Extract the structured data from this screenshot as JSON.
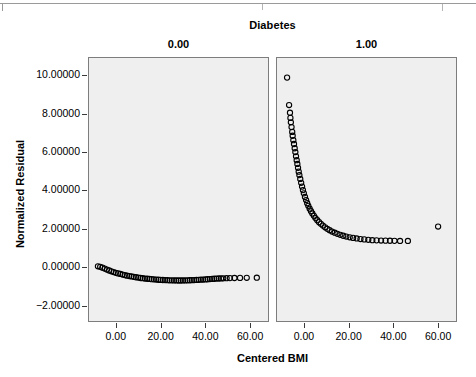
{
  "chart_data": {
    "type": "scatter",
    "title": "Diabetes",
    "xlabel": "Centered BMI",
    "ylabel": "Normalized Residual",
    "grid": false,
    "legend": "none",
    "facet_variable": "Diabetes",
    "panels": [
      {
        "label": "0.00",
        "xlim": [
          -12.0,
          68.0
        ],
        "ylim": [
          -2.8,
          10.9
        ],
        "xticks": [
          0.0,
          20.0,
          40.0,
          60.0
        ],
        "xticklabels": [
          "0.00",
          "20.00",
          "40.00",
          "60.00"
        ],
        "points": [
          {
            "x": -8.0,
            "y": 0.05
          },
          {
            "x": -7.0,
            "y": 0.02
          },
          {
            "x": -6.0,
            "y": -0.02
          },
          {
            "x": -5.0,
            "y": -0.07
          },
          {
            "x": -4.0,
            "y": -0.12
          },
          {
            "x": -3.0,
            "y": -0.17
          },
          {
            "x": -2.0,
            "y": -0.21
          },
          {
            "x": -1.0,
            "y": -0.25
          },
          {
            "x": 0.0,
            "y": -0.29
          },
          {
            "x": 1.0,
            "y": -0.32
          },
          {
            "x": 2.0,
            "y": -0.35
          },
          {
            "x": 3.0,
            "y": -0.38
          },
          {
            "x": 4.0,
            "y": -0.41
          },
          {
            "x": 5.0,
            "y": -0.44
          },
          {
            "x": 6.0,
            "y": -0.46
          },
          {
            "x": 7.0,
            "y": -0.48
          },
          {
            "x": 8.0,
            "y": -0.5
          },
          {
            "x": 9.0,
            "y": -0.52
          },
          {
            "x": 10.0,
            "y": -0.54
          },
          {
            "x": 11.0,
            "y": -0.56
          },
          {
            "x": 12.0,
            "y": -0.57
          },
          {
            "x": 13.0,
            "y": -0.59
          },
          {
            "x": 14.0,
            "y": -0.6
          },
          {
            "x": 15.0,
            "y": -0.61
          },
          {
            "x": 16.0,
            "y": -0.62
          },
          {
            "x": 17.0,
            "y": -0.63
          },
          {
            "x": 18.0,
            "y": -0.64
          },
          {
            "x": 19.0,
            "y": -0.65
          },
          {
            "x": 20.0,
            "y": -0.66
          },
          {
            "x": 21.0,
            "y": -0.665
          },
          {
            "x": 22.0,
            "y": -0.67
          },
          {
            "x": 23.0,
            "y": -0.675
          },
          {
            "x": 24.0,
            "y": -0.68
          },
          {
            "x": 25.0,
            "y": -0.683
          },
          {
            "x": 26.0,
            "y": -0.686
          },
          {
            "x": 27.0,
            "y": -0.688
          },
          {
            "x": 28.0,
            "y": -0.69
          },
          {
            "x": 29.0,
            "y": -0.69
          },
          {
            "x": 30.0,
            "y": -0.688
          },
          {
            "x": 31.0,
            "y": -0.685
          },
          {
            "x": 32.0,
            "y": -0.682
          },
          {
            "x": 33.0,
            "y": -0.678
          },
          {
            "x": 34.0,
            "y": -0.673
          },
          {
            "x": 35.0,
            "y": -0.668
          },
          {
            "x": 36.0,
            "y": -0.662
          },
          {
            "x": 37.0,
            "y": -0.655
          },
          {
            "x": 38.0,
            "y": -0.648
          },
          {
            "x": 39.0,
            "y": -0.64
          },
          {
            "x": 40.0,
            "y": -0.632
          },
          {
            "x": 41.0,
            "y": -0.624
          },
          {
            "x": 42.0,
            "y": -0.615
          },
          {
            "x": 43.0,
            "y": -0.606
          },
          {
            "x": 44.0,
            "y": -0.6
          },
          {
            "x": 45.0,
            "y": -0.59
          },
          {
            "x": 46.0,
            "y": -0.585
          },
          {
            "x": 47.0,
            "y": -0.58
          },
          {
            "x": 48.0,
            "y": -0.575
          },
          {
            "x": 49.5,
            "y": -0.57
          },
          {
            "x": 51.0,
            "y": -0.565
          },
          {
            "x": 53.0,
            "y": -0.56
          },
          {
            "x": 55.5,
            "y": -0.555
          },
          {
            "x": 58.5,
            "y": -0.55
          },
          {
            "x": 63.0,
            "y": -0.545
          }
        ]
      },
      {
        "label": "1.00",
        "xlim": [
          -12.0,
          68.0
        ],
        "ylim": [
          -2.8,
          10.9
        ],
        "xticks": [
          0.0,
          20.0,
          40.0,
          60.0
        ],
        "xticklabels": [
          "0.00",
          "20.00",
          "40.00",
          "60.00"
        ],
        "points": [
          {
            "x": -7.5,
            "y": 9.88
          },
          {
            "x": -6.6,
            "y": 8.45
          },
          {
            "x": -6.2,
            "y": 8.05
          },
          {
            "x": -6.0,
            "y": 7.78
          },
          {
            "x": -5.8,
            "y": 7.55
          },
          {
            "x": -5.5,
            "y": 7.3
          },
          {
            "x": -5.2,
            "y": 7.05
          },
          {
            "x": -5.0,
            "y": 6.85
          },
          {
            "x": -4.7,
            "y": 6.62
          },
          {
            "x": -4.4,
            "y": 6.42
          },
          {
            "x": -4.1,
            "y": 6.2
          },
          {
            "x": -3.8,
            "y": 6.0
          },
          {
            "x": -3.5,
            "y": 5.78
          },
          {
            "x": -3.2,
            "y": 5.58
          },
          {
            "x": -2.9,
            "y": 5.38
          },
          {
            "x": -2.6,
            "y": 5.18
          },
          {
            "x": -2.3,
            "y": 4.98
          },
          {
            "x": -2.0,
            "y": 4.8
          },
          {
            "x": -1.6,
            "y": 4.6
          },
          {
            "x": -1.2,
            "y": 4.4
          },
          {
            "x": -0.8,
            "y": 4.2
          },
          {
            "x": -0.4,
            "y": 4.02
          },
          {
            "x": 0.0,
            "y": 3.85
          },
          {
            "x": 0.5,
            "y": 3.66
          },
          {
            "x": 1.0,
            "y": 3.5
          },
          {
            "x": 1.5,
            "y": 3.34
          },
          {
            "x": 2.0,
            "y": 3.2
          },
          {
            "x": 2.6,
            "y": 3.05
          },
          {
            "x": 3.2,
            "y": 2.92
          },
          {
            "x": 3.8,
            "y": 2.8
          },
          {
            "x": 4.5,
            "y": 2.68
          },
          {
            "x": 5.2,
            "y": 2.56
          },
          {
            "x": 6.0,
            "y": 2.45
          },
          {
            "x": 6.8,
            "y": 2.35
          },
          {
            "x": 7.6,
            "y": 2.26
          },
          {
            "x": 8.5,
            "y": 2.17
          },
          {
            "x": 9.5,
            "y": 2.08
          },
          {
            "x": 10.5,
            "y": 2.0
          },
          {
            "x": 11.5,
            "y": 1.93
          },
          {
            "x": 12.6,
            "y": 1.86
          },
          {
            "x": 13.8,
            "y": 1.8
          },
          {
            "x": 15.0,
            "y": 1.74
          },
          {
            "x": 16.3,
            "y": 1.69
          },
          {
            "x": 17.6,
            "y": 1.64
          },
          {
            "x": 19.0,
            "y": 1.6
          },
          {
            "x": 20.5,
            "y": 1.56
          },
          {
            "x": 22.0,
            "y": 1.53
          },
          {
            "x": 23.6,
            "y": 1.5
          },
          {
            "x": 25.3,
            "y": 1.47
          },
          {
            "x": 27.0,
            "y": 1.45
          },
          {
            "x": 28.8,
            "y": 1.43
          },
          {
            "x": 30.6,
            "y": 1.41
          },
          {
            "x": 32.5,
            "y": 1.4
          },
          {
            "x": 34.5,
            "y": 1.39
          },
          {
            "x": 36.5,
            "y": 1.385
          },
          {
            "x": 38.5,
            "y": 1.38
          },
          {
            "x": 40.5,
            "y": 1.375
          },
          {
            "x": 43.0,
            "y": 1.37
          },
          {
            "x": 46.5,
            "y": 1.37
          },
          {
            "x": 60.0,
            "y": 2.12
          }
        ]
      }
    ],
    "yticks": [
      10.0,
      8.0,
      6.0,
      4.0,
      2.0,
      0.0,
      -2.0
    ],
    "yticklabels": [
      "10.00000",
      "8.00000",
      "6.00000",
      "4.00000",
      "2.00000",
      "0.00000",
      "−2.00000"
    ]
  },
  "colors": {
    "panel_background": "#efefef",
    "panel_border": "#7d7d7d",
    "marker": "#000000",
    "text": "#000000"
  }
}
